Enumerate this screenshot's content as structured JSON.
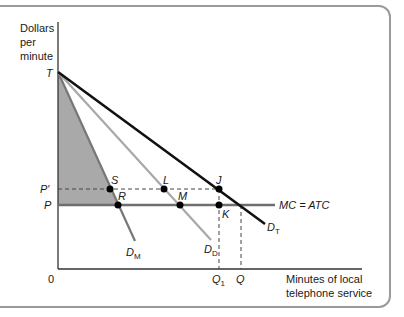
{
  "diagram": {
    "y_axis_label": [
      "Dollars",
      "per",
      "minute"
    ],
    "x_axis_label": [
      "Minutes of local",
      "telephone service"
    ],
    "origin_label": "0",
    "price_labels": {
      "top": "T",
      "p_prime": "P′",
      "p": "P"
    },
    "quantity_labels": {
      "q1": "Q",
      "q1_sub": "1",
      "q": "Q"
    },
    "curves": {
      "mc_atc": "MC = ATC",
      "d_m": {
        "base": "D",
        "sub": "M"
      },
      "d_d": {
        "base": "D",
        "sub": "D"
      },
      "d_t": {
        "base": "D",
        "sub": "T"
      }
    },
    "points": [
      "S",
      "R",
      "L",
      "M",
      "J",
      "K"
    ],
    "colors": {
      "frame": "#9a9a9a",
      "axis": "#333333",
      "d_t": "#111111",
      "d_d": "#a8a8a8",
      "d_m": "#777777",
      "mc_atc": "#6e6e6e",
      "shaded_area": "#a9a9a9",
      "dashed": "#444444"
    }
  }
}
